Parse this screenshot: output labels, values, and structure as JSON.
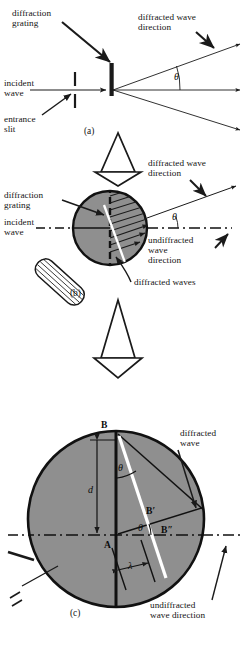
{
  "figure": {
    "colors": {
      "disc_fill": "#8f8f8f",
      "disc_stroke": "#111111",
      "line": "#1a1a1a",
      "wavefront": "#ffffff",
      "background": "#ffffff"
    },
    "panels": [
      {
        "id": "a",
        "id_label": "(a)",
        "labels": {
          "grating": "diffraction\ngrating",
          "incident": "incident\nwave",
          "slit": "entrance\nslit",
          "diffracted_direction": "diffracted wave\ndirection",
          "angle": "θ"
        }
      },
      {
        "id": "b",
        "id_label": "(b)",
        "labels": {
          "grating": "diffraction\ngrating",
          "incident": "incident\nwave",
          "diffracted_direction": "diffracted wave\ndirection",
          "undiffracted_direction": "undiffracted\nwave\ndirection",
          "diffracted_waves": "diffracted waves",
          "angle": "θ"
        }
      },
      {
        "id": "c",
        "id_label": "(c)",
        "labels": {
          "diffracted_wave": "diffracted\nwave",
          "undiffracted_direction": "undiffracted\nwave direction",
          "point_b": "B",
          "point_a": "A",
          "point_b_prime": "B′",
          "point_b_dprime": "B″",
          "spacing": "d",
          "wavelength": "λ",
          "angle_top": "θ",
          "angle_bottom": "θ"
        }
      }
    ],
    "zoom_arrows": [
      {
        "name": "zoom-arrow-a-to-b"
      },
      {
        "name": "zoom-arrow-b-to-c"
      }
    ]
  }
}
